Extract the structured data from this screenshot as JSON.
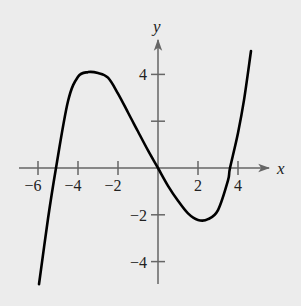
{
  "chart_data": {
    "type": "line",
    "title": "",
    "xlabel": "x",
    "ylabel": "y",
    "xlim": [
      -6.5,
      5.5
    ],
    "ylim": [
      -5,
      5.5
    ],
    "x_ticks": [
      -6,
      -4,
      -2,
      2,
      4
    ],
    "x_tick_labels": [
      "−6",
      "−4",
      "−2",
      "2",
      "4"
    ],
    "y_ticks": [
      4,
      2,
      -2,
      -4
    ],
    "y_tick_labels": [
      "4",
      "",
      "−2",
      "−4"
    ],
    "grid": false,
    "legend": null,
    "series": [
      {
        "name": "f(x)",
        "description": "cubic with zeros near x=-5.1, 0, 3.6; local max about (-3, 4); local min about (2, -2.2)",
        "x": [
          -5.95,
          -5.5,
          -5.1,
          -4.5,
          -4,
          -3.5,
          -3,
          -2.5,
          -2,
          -1.5,
          -1,
          -0.5,
          0,
          0.5,
          1,
          1.5,
          2,
          2.5,
          3,
          3.5,
          3.6,
          4,
          4.3,
          4.65
        ],
        "y": [
          -4.97,
          -2.17,
          0.0,
          2.85,
          3.9,
          4.1,
          4.06,
          3.86,
          3.18,
          2.37,
          1.56,
          0.75,
          0.0,
          -0.76,
          -1.4,
          -1.94,
          -2.22,
          -2.19,
          -1.8,
          -0.53,
          0.0,
          1.5,
          2.9,
          5.0
        ]
      }
    ],
    "colors": {
      "curve": "#000000",
      "axes": "#666666",
      "background": "#ececec"
    }
  }
}
